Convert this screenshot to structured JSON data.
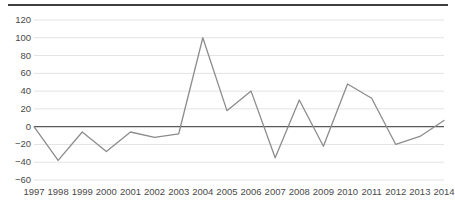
{
  "chart_data": {
    "type": "line",
    "title": "",
    "subtitle": "",
    "xlabel": "",
    "ylabel": "",
    "categories": [
      "1997",
      "1998",
      "1999",
      "2000",
      "2001",
      "2002",
      "2003",
      "2004",
      "2005",
      "2006",
      "2007",
      "2008",
      "2009",
      "2010",
      "2011",
      "2012",
      "2013",
      "2014"
    ],
    "values": [
      0,
      -38,
      -6,
      -28,
      -6,
      -12,
      -8,
      100,
      18,
      40,
      -35,
      30,
      -22,
      48,
      32,
      -20,
      -11,
      7
    ],
    "series": [
      {
        "name": "",
        "values": [
          0,
          -38,
          -6,
          -28,
          -6,
          -12,
          -8,
          100,
          18,
          40,
          -35,
          30,
          -22,
          48,
          32,
          -20,
          -11,
          7
        ]
      }
    ],
    "ylim": [
      -60,
      120
    ],
    "xlim": [
      "1997",
      "2014"
    ],
    "y_ticks": [
      120,
      100,
      80,
      60,
      40,
      20,
      0,
      -20,
      -40,
      -60
    ],
    "y_tick_labels": [
      "120",
      "100",
      "80",
      "60",
      "40",
      "20",
      "0",
      "−20",
      "−40",
      "−60"
    ],
    "x_tick_labels": [
      "1997",
      "1998",
      "1999",
      "2000",
      "2001",
      "2002",
      "2003",
      "2004",
      "2005",
      "2006",
      "2007",
      "2008",
      "2009",
      "2010",
      "2011",
      "2012",
      "2013",
      "2014"
    ],
    "grid": true,
    "grid_axis": "y",
    "legend": false,
    "legend_position": "none",
    "annotations": [],
    "colors": {
      "line": "#8c8c8c",
      "gridline": "#e3e3e3",
      "zero_axis": "#595959",
      "top_rule": "#3f3f3f",
      "tick_label": "#4a4a4a",
      "background": "#ffffff"
    }
  }
}
